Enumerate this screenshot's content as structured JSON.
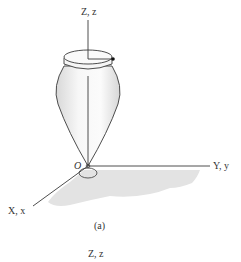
{
  "figure": {
    "caption": "(a)",
    "axes": {
      "z_label": "Z, z",
      "y_label": "Y, y",
      "x_label": "X, x",
      "origin_label": "O"
    },
    "next_figure_z_label": "Z, z"
  },
  "colors": {
    "line": "#3a3a3a",
    "floor_shade": "#e3e3e3",
    "body_fill": "#f4f4f4",
    "dot": "#111111"
  }
}
